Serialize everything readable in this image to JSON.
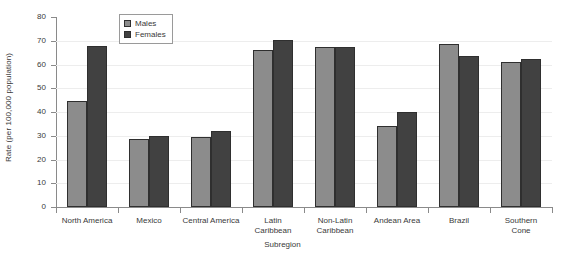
{
  "chart_data": {
    "type": "bar",
    "title": "",
    "xlabel": "Subregion",
    "ylabel": "Rate (per 100,000 population)",
    "ylim": [
      0,
      80
    ],
    "yticks": [
      0,
      10,
      20,
      30,
      40,
      50,
      60,
      70,
      80
    ],
    "grid": true,
    "legend_position": "top-left-inside",
    "categories": [
      "North America",
      "Mexico",
      "Central America",
      "Latin Caribbean",
      "Non-Latin Caribbean",
      "Andean Area",
      "Brazil",
      "Southern Cone"
    ],
    "category_lines": [
      [
        "North America"
      ],
      [
        "Mexico"
      ],
      [
        "Central America"
      ],
      [
        "Latin",
        "Caribbean"
      ],
      [
        "Non-Latin",
        "Caribbean"
      ],
      [
        "Andean Area"
      ],
      [
        "Brazil"
      ],
      [
        "Southern",
        "Cone"
      ]
    ],
    "series": [
      {
        "name": "Males",
        "color": "#8c8c8c",
        "values": [
          44.5,
          28.5,
          29.5,
          66.0,
          67.5,
          34.0,
          68.5,
          61.0
        ]
      },
      {
        "name": "Females",
        "color": "#414141",
        "values": [
          68.0,
          30.0,
          32.0,
          70.5,
          67.5,
          40.0,
          63.5,
          62.5
        ]
      }
    ]
  },
  "legend": {
    "items": [
      {
        "label": "Males"
      },
      {
        "label": "Females"
      }
    ]
  }
}
